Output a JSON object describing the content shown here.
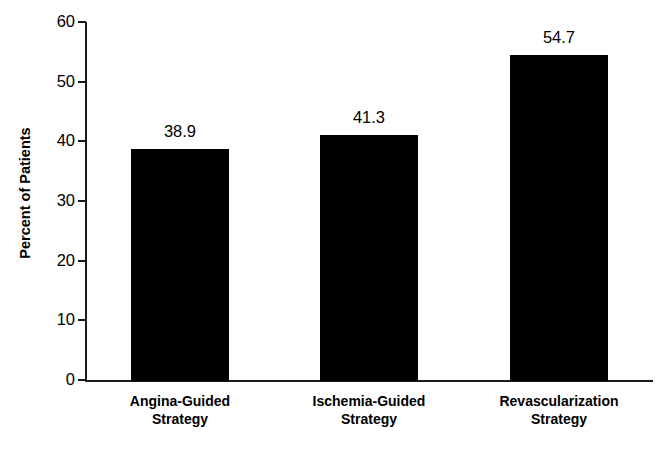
{
  "chart_data": {
    "type": "bar",
    "title": "",
    "subtitle": "",
    "xlabel": "",
    "ylabel": "Percent of Patients",
    "ylim": [
      0,
      60
    ],
    "ytick_values": [
      60,
      50,
      40,
      30,
      20,
      10,
      0
    ],
    "ytick_labels": [
      "60",
      "50",
      "40",
      "30",
      "20",
      "10",
      "0"
    ],
    "grid": false,
    "legend": false,
    "legend_position": "none",
    "bar_color": "#000000",
    "background_color": "#ffffff",
    "axis_color": "#1a1a1a",
    "categories": [
      "Angina-Guided Strategy",
      "Ischemia-Guided Strategy",
      "Revascularization Strategy"
    ],
    "category_lines": [
      [
        "Angina-Guided",
        "Strategy"
      ],
      [
        "Ischemia-Guided",
        "Strategy"
      ],
      [
        "Revascularization",
        "Strategy"
      ]
    ],
    "values": [
      38.9,
      41.3,
      54.7
    ],
    "value_labels": [
      "38.9",
      "41.3",
      "54.7"
    ]
  }
}
